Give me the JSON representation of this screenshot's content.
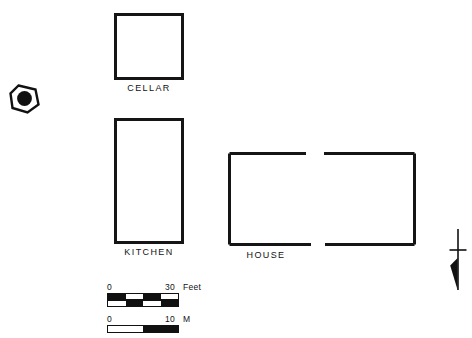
{
  "figure": {
    "type": "archaeological-site-plan",
    "background_color": "#ffffff",
    "line_color": "#151515"
  },
  "structures": [
    {
      "id": "cellar",
      "label": "CELLAR",
      "shape": "rectangle"
    },
    {
      "id": "kitchen",
      "label": "KITCHEN",
      "shape": "rectangle"
    },
    {
      "id": "house",
      "label": "HOUSE",
      "shape": "rectangle-with-gaps"
    }
  ],
  "labels": {
    "cellar": "CELLAR",
    "kitchen": "KITCHEN",
    "house": "HOUSE"
  },
  "markers": {
    "datum": {
      "name": "datum-point-marker",
      "description": "filled circle within rotated polygon outline"
    },
    "north_arrow": {
      "name": "north-arrow",
      "description": "vertical staff with crossbar and solid tapered point"
    }
  },
  "scale_bars": [
    {
      "id": "feet",
      "zero_label": "0",
      "max_label": "30",
      "unit_label": "Feet",
      "rows": [
        [
          "black",
          "white",
          "black",
          "white"
        ],
        [
          "white",
          "black",
          "white",
          "black"
        ]
      ]
    },
    {
      "id": "meters",
      "zero_label": "0",
      "max_label": "10",
      "unit_label": "M",
      "rows": [
        [
          "white",
          "black"
        ]
      ]
    }
  ]
}
